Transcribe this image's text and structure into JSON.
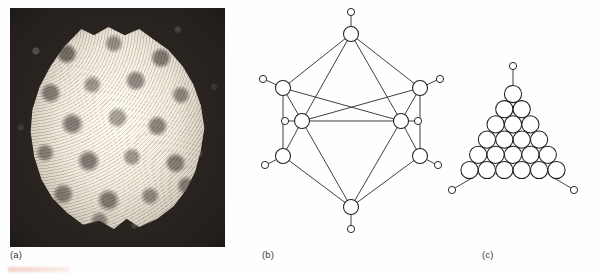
{
  "figure": {
    "background_color": "#fefefe",
    "line_color": "#2b2b2b",
    "width": 601,
    "height": 274
  },
  "panels": [
    {
      "id": "a",
      "caption": "(a)",
      "type": "electron-micrograph",
      "name": "virus-capsid-micrograph",
      "photo": {
        "x": 10,
        "y": 8,
        "width": 215,
        "height": 239,
        "background_color": "#241f1c",
        "particle_color": "#ddd7cb",
        "particle": {
          "x": 17,
          "y": 17,
          "width": 181,
          "height": 206,
          "shape": "rounded-icosahedral-outline",
          "texture": "granular-capsomere-mottling"
        }
      }
    },
    {
      "id": "b",
      "caption": "(b)",
      "type": "icosahedron-model",
      "name": "icosahedron-diagram",
      "vertices": [
        {
          "name": "vertex-top",
          "x": 351,
          "y": 34,
          "r": 7.5,
          "stub_to": {
            "x": 351,
            "y": 12,
            "r": 3.6
          }
        },
        {
          "name": "vertex-upper-left",
          "x": 283,
          "y": 88,
          "r": 7.5,
          "stub_to": {
            "x": 263,
            "y": 79,
            "r": 3.6
          }
        },
        {
          "name": "vertex-upper-right",
          "x": 420,
          "y": 88,
          "r": 7.5,
          "stub_to": {
            "x": 440,
            "y": 79,
            "r": 3.6
          }
        },
        {
          "name": "vertex-mid-left",
          "x": 302,
          "y": 121,
          "r": 7.5,
          "stub_to": {
            "x": 285,
            "y": 121,
            "r": 3.6
          }
        },
        {
          "name": "vertex-mid-right",
          "x": 401,
          "y": 121,
          "r": 7.5,
          "stub_to": {
            "x": 418,
            "y": 121,
            "r": 3.6
          }
        },
        {
          "name": "vertex-lower-left",
          "x": 283,
          "y": 156,
          "r": 7.5,
          "stub_to": {
            "x": 265,
            "y": 165,
            "r": 3.6
          }
        },
        {
          "name": "vertex-lower-right",
          "x": 420,
          "y": 156,
          "r": 7.5,
          "stub_to": {
            "x": 438,
            "y": 165,
            "r": 3.6
          }
        },
        {
          "name": "vertex-bottom",
          "x": 351,
          "y": 207,
          "r": 7.5,
          "stub_to": {
            "x": 351,
            "y": 229,
            "r": 3.6
          }
        }
      ],
      "edges": [
        [
          351,
          34,
          283,
          88
        ],
        [
          351,
          34,
          420,
          88
        ],
        [
          351,
          34,
          302,
          121
        ],
        [
          351,
          34,
          401,
          121
        ],
        [
          283,
          88,
          302,
          121
        ],
        [
          420,
          88,
          401,
          121
        ],
        [
          283,
          88,
          283,
          156
        ],
        [
          420,
          88,
          420,
          156
        ],
        [
          302,
          121,
          401,
          121
        ],
        [
          302,
          121,
          283,
          156
        ],
        [
          401,
          121,
          420,
          156
        ],
        [
          302,
          121,
          351,
          207
        ],
        [
          401,
          121,
          351,
          207
        ],
        [
          283,
          156,
          351,
          207
        ],
        [
          420,
          156,
          351,
          207
        ],
        [
          283,
          88,
          401,
          121
        ],
        [
          420,
          88,
          302,
          121
        ]
      ]
    },
    {
      "id": "c",
      "caption": "(c)",
      "type": "triangular-facet",
      "name": "capsomere-facet-diagram",
      "facet": {
        "rows": [
          1,
          2,
          3,
          4,
          5,
          6
        ],
        "total_capsomeres": 21,
        "apex_x": 513,
        "apex_y": 94,
        "radius": 8.6,
        "row_spacing": 15.2,
        "col_spacing": 17.4
      },
      "corner_stubs": [
        {
          "name": "stub-apex",
          "from": {
            "x": 513,
            "y": 86
          },
          "to": {
            "x": 513,
            "y": 66
          },
          "r": 3.6
        },
        {
          "name": "stub-bottom-left",
          "from": {
            "x": 470,
            "y": 178
          },
          "to": {
            "x": 452,
            "y": 189
          },
          "r": 3.6
        },
        {
          "name": "stub-bottom-right",
          "from": {
            "x": 556,
            "y": 178
          },
          "to": {
            "x": 574,
            "y": 189
          },
          "r": 3.6
        }
      ]
    }
  ]
}
